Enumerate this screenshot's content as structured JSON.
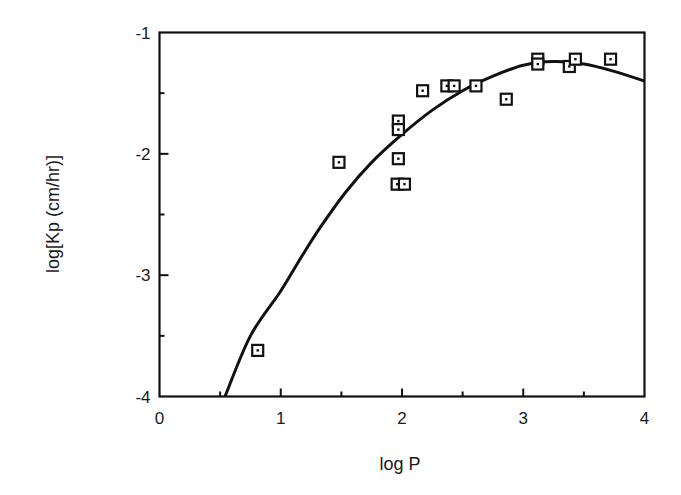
{
  "chart_data": {
    "type": "scatter",
    "title": "",
    "xlabel": "log P",
    "ylabel": "log[Kp (cm/hr)]",
    "xlim": [
      0,
      4
    ],
    "ylim": [
      -4,
      -1
    ],
    "x_ticks": [
      0,
      1,
      2,
      3,
      4
    ],
    "x_tick_labels": [
      "0",
      "1",
      "2",
      "3",
      "4"
    ],
    "x_minor_ticks": [
      0.5,
      1.5,
      2.5,
      3.5
    ],
    "y_ticks": [
      -1,
      -2,
      -3,
      -4
    ],
    "y_tick_labels": [
      "-1",
      "-2",
      "-3",
      "-4"
    ],
    "y_minor_ticks": [
      -1.5,
      -2.5,
      -3.5
    ],
    "grid": false,
    "legend": null,
    "series": [
      {
        "name": "measured",
        "kind": "scatter",
        "marker": "open-square",
        "points": [
          {
            "x": 0.81,
            "y": -3.62
          },
          {
            "x": 1.48,
            "y": -2.07
          },
          {
            "x": 1.97,
            "y": -1.73
          },
          {
            "x": 1.97,
            "y": -1.8
          },
          {
            "x": 1.97,
            "y": -2.04
          },
          {
            "x": 1.96,
            "y": -2.25
          },
          {
            "x": 2.02,
            "y": -2.25
          },
          {
            "x": 2.17,
            "y": -1.48
          },
          {
            "x": 2.37,
            "y": -1.44
          },
          {
            "x": 2.43,
            "y": -1.44
          },
          {
            "x": 2.61,
            "y": -1.44
          },
          {
            "x": 2.86,
            "y": -1.55
          },
          {
            "x": 3.12,
            "y": -1.22
          },
          {
            "x": 3.12,
            "y": -1.26
          },
          {
            "x": 3.38,
            "y": -1.28
          },
          {
            "x": 3.43,
            "y": -1.22
          },
          {
            "x": 3.72,
            "y": -1.22
          }
        ]
      },
      {
        "name": "fitted curve",
        "kind": "line",
        "points": [
          {
            "x": 0.54,
            "y": -4.0
          },
          {
            "x": 0.75,
            "y": -3.5
          },
          {
            "x": 1.0,
            "y": -3.13
          },
          {
            "x": 1.17,
            "y": -2.85
          },
          {
            "x": 1.33,
            "y": -2.6
          },
          {
            "x": 1.54,
            "y": -2.31
          },
          {
            "x": 1.75,
            "y": -2.07
          },
          {
            "x": 2.0,
            "y": -1.84
          },
          {
            "x": 2.25,
            "y": -1.64
          },
          {
            "x": 2.5,
            "y": -1.48
          },
          {
            "x": 2.75,
            "y": -1.36
          },
          {
            "x": 3.0,
            "y": -1.27
          },
          {
            "x": 3.25,
            "y": -1.24
          },
          {
            "x": 3.5,
            "y": -1.26
          },
          {
            "x": 3.75,
            "y": -1.32
          },
          {
            "x": 4.0,
            "y": -1.4
          }
        ]
      }
    ]
  },
  "labels": {
    "x_axis": "log P",
    "y_axis": "log[Kp (cm/hr)]"
  }
}
